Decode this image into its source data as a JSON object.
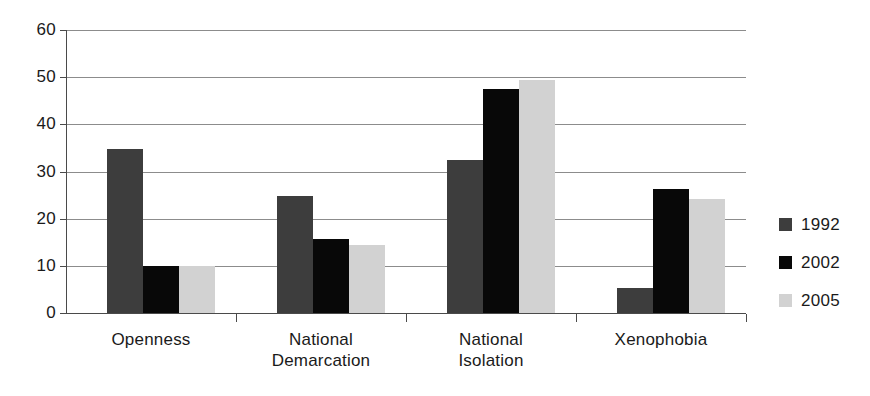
{
  "chart_data": {
    "type": "bar",
    "title": "",
    "subtitle": "",
    "xlabel": "",
    "ylabel": "",
    "ylim": [
      0,
      60
    ],
    "yticks": [
      0,
      10,
      20,
      30,
      40,
      50,
      60
    ],
    "ytick_labels": [
      "0",
      "10",
      "20",
      "30",
      "40",
      "50",
      "60"
    ],
    "grid": true,
    "legend_position": "right",
    "categories": [
      "Openness",
      "National Demarcation",
      "National Isolation",
      "Xenophobia"
    ],
    "category_label_lines": [
      [
        "Openness"
      ],
      [
        "National",
        "Demarcation"
      ],
      [
        "National",
        "Isolation"
      ],
      [
        "Xenophobia"
      ]
    ],
    "series": [
      {
        "name": "1992",
        "color": "#3d3d3d",
        "values": [
          34.8,
          24.8,
          32.4,
          5.2
        ]
      },
      {
        "name": "2002",
        "color": "#080808",
        "values": [
          10.0,
          15.7,
          47.4,
          26.3
        ]
      },
      {
        "name": "2005",
        "color": "#d2d2d2",
        "values": [
          9.9,
          14.5,
          49.4,
          24.2
        ]
      }
    ]
  },
  "legend": {
    "items": [
      {
        "label": "1992",
        "swatch": "legend-swatch-1992"
      },
      {
        "label": "2002",
        "swatch": "legend-swatch-2002"
      },
      {
        "label": "2005",
        "swatch": "legend-swatch-2005"
      }
    ]
  }
}
